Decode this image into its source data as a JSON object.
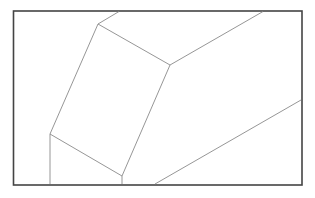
{
  "figure": {
    "colors": {
      "background": "#ffffff",
      "frame": "#444444",
      "lines": "#8a8a8a"
    }
  }
}
